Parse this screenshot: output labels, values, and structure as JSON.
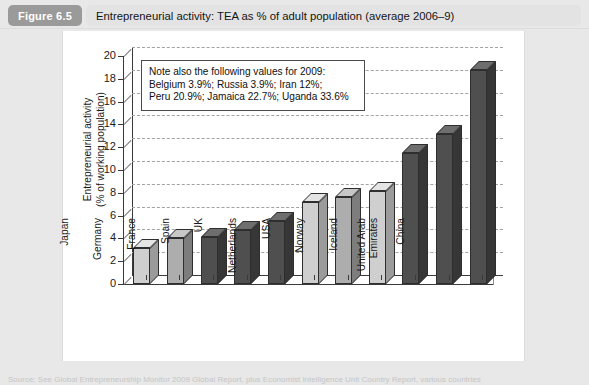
{
  "figure": {
    "tag": "Figure 6.5",
    "title": "Entrepreneurial activity: TEA as % of adult population (average 2006–9)"
  },
  "annotation": {
    "text": "Note also the following values for 2009:\nBelgium 3.9%; Russia 3.9%; Iran 12%;\nPeru 20.9%; Jamaica 22.7%; Uganda 33.6%"
  },
  "source": {
    "text": "Source: See Global Entrepreneurship Monitor 2009 Global Report, plus Economist Intelligence Unit Country Report, various countries"
  },
  "colors": {
    "bar_light": "#c9c9c9",
    "bar_dark": "#4a4a4a",
    "bar_mid": "#a8a8a8",
    "panel": "#ffffff",
    "page": "#e8e8e8",
    "tag": "#9a9a9a",
    "grid": "#a2a2a2",
    "axis": "#3a3a3a"
  },
  "chart_data": {
    "type": "bar",
    "title": "Entrepreneurial activity: TEA as % of adult population (average 2006–9)",
    "xlabel": "",
    "ylabel": "Entrepreneurial activity\n(% of working population)",
    "ylim": [
      0,
      20
    ],
    "yticks": [
      0,
      2,
      4,
      6,
      8,
      10,
      12,
      14,
      16,
      18,
      20
    ],
    "grid": true,
    "legend": "none",
    "categories": [
      "Japan",
      "Germany",
      "France",
      "Spain",
      "UK",
      "Netherlands",
      "USA",
      "Norway",
      "Iceland",
      "United Arab\nEmirates",
      "China"
    ],
    "values": [
      3.2,
      4.0,
      4.1,
      4.7,
      5.5,
      7.2,
      7.6,
      8.2,
      11.5,
      13.2,
      18.8
    ],
    "bar_shades": [
      "light",
      "mid",
      "dark",
      "dark",
      "dark",
      "light",
      "mid",
      "light",
      "dark",
      "dark",
      "dark"
    ],
    "annotations": [
      "Note also the following values for 2009:",
      "Belgium 3.9%; Russia 3.9%; Iran 12%;",
      "Peru 20.9%; Jamaica 22.7%; Uganda 33.6%"
    ]
  }
}
